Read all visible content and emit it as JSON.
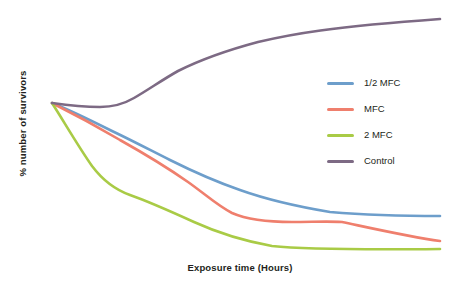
{
  "chart_data": {
    "type": "line",
    "title": "",
    "subtitle": "",
    "xlabel": "Exposure time (Hours)",
    "ylabel": "% number of survivors",
    "grid": false,
    "axis_ticks": false,
    "axis_lines": false,
    "legend_position": "top-right",
    "background_color": "#ffffff",
    "xlim": [
      0,
      100
    ],
    "ylim": [
      0,
      100
    ],
    "x_tick_labels": [],
    "y_tick_labels": [],
    "annotations": [],
    "note": "Schematic survival curves; axes are unlabeled with no numeric ticks. Values below are read off the plot as relative percentages of the common starting point.",
    "x": [
      0,
      10,
      20,
      30,
      40,
      50,
      60,
      70,
      80,
      90,
      100
    ],
    "series": [
      {
        "name": "1/2 MFC",
        "color": "#6d9ecb",
        "values": [
          100,
          93,
          86,
          80,
          75,
          69,
          63,
          57,
          51,
          45,
          41
        ]
      },
      {
        "name": "MFC",
        "color": "#ef7f6d",
        "values": [
          100,
          90,
          80,
          70,
          61,
          52,
          44,
          39,
          37,
          35,
          29
        ]
      },
      {
        "name": "2 MFC",
        "color": "#a9cb46",
        "values": [
          100,
          79,
          61,
          49,
          43,
          38,
          33,
          29,
          26,
          25,
          24
        ]
      },
      {
        "name": "Control",
        "color": "#7d6a84",
        "values": [
          100,
          99,
          98,
          100,
          107,
          115,
          123,
          131,
          139,
          147,
          155
        ]
      }
    ]
  },
  "plot": {
    "paths": [
      {
        "name": "1/2 MFC",
        "color": "#6d9ecb",
        "d": "M 52,103 C 70,110 92,121 112,131 C 133,141 152,151 170,160 C 190,170 214,181 240,190 C 268,200 300,207 330,212 C 366,215 410,216 440,216"
      },
      {
        "name": "MFC",
        "color": "#ef7f6d",
        "d": "M 52,103 C 72,113 98,127 120,140 C 145,154 168,168 188,182 C 205,194 218,206 232,213 C 248,220 268,222 292,222 C 312,222 328,221 342,222 C 366,227 410,237 440,241"
      },
      {
        "name": "2 MFC",
        "color": "#a9cb46",
        "d": "M 52,103 C 63,120 78,146 92,166 C 104,182 116,190 130,195 C 150,202 172,212 194,222 C 216,232 244,241 272,246 C 300,249 340,250 440,249"
      },
      {
        "name": "Control",
        "color": "#7d6a84",
        "d": "M 52,103 C 66,105 84,107 100,107 C 112,107 122,105 134,98 C 148,90 162,80 178,71 C 200,60 228,50 258,42 C 292,34 330,27 440,19"
      }
    ]
  },
  "legend": {
    "items": [
      {
        "label": "1/2 MFC",
        "color": "#6d9ecb"
      },
      {
        "label": "MFC",
        "color": "#ef7f6d"
      },
      {
        "label": "2 MFC",
        "color": "#a9cb46"
      },
      {
        "label": "Control",
        "color": "#7d6a84"
      }
    ]
  }
}
